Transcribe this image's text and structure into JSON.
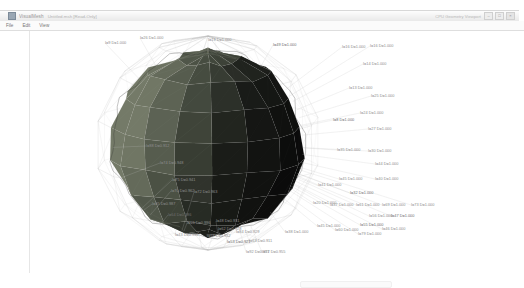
{
  "window": {
    "title": "VisualMesh",
    "subtitle": "Untitled.msh  [Read-Only]",
    "right_status": "CPU  Geometry Viewport",
    "controls": {
      "minimize": "–",
      "maximize": "□",
      "close": "×"
    }
  },
  "menubar": {
    "items": [
      "File",
      "Edit",
      "View"
    ]
  },
  "canvas": {
    "background": "#ffffff",
    "wire_color": "#b9b9b9",
    "outline_color": "#9b9b9b",
    "face_light": "#6a6f66",
    "face_mid": "#4a4f49",
    "face_dark": "#191919",
    "face_darkest": "#0a0a0a",
    "label_color": "#8e8e8e"
  },
  "vertex_labels": [
    {
      "text": "I=9 D=1.000",
      "x": 75,
      "y": 10
    },
    {
      "text": "I=26 D=1.000",
      "x": 110,
      "y": 5
    },
    {
      "text": "I=19 D=1.000",
      "x": 178,
      "y": 7
    },
    {
      "text": "I=49 D=1.000",
      "x": 243,
      "y": 12
    },
    {
      "text": "I=16 D=1.000",
      "x": 312,
      "y": 14
    },
    {
      "text": "I=16 D=1.000",
      "x": 340,
      "y": 13
    },
    {
      "text": "I=14 D=1.000",
      "x": 333,
      "y": 31
    },
    {
      "text": "I=13 D=1.000",
      "x": 319,
      "y": 55
    },
    {
      "text": "I=25 D=1.000",
      "x": 341,
      "y": 63
    },
    {
      "text": "I=24 D=1.000",
      "x": 330,
      "y": 80
    },
    {
      "text": "I=8 D=1.000",
      "x": 303,
      "y": 87
    },
    {
      "text": "I=27 D=1.000",
      "x": 338,
      "y": 96
    },
    {
      "text": "I=35 D=1.000",
      "x": 307,
      "y": 117
    },
    {
      "text": "I=30 D=1.000",
      "x": 338,
      "y": 118
    },
    {
      "text": "I=44 D=1.000",
      "x": 345,
      "y": 131
    },
    {
      "text": "I=40 D=1.000",
      "x": 345,
      "y": 146
    },
    {
      "text": "I=45 D=1.000",
      "x": 309,
      "y": 146
    },
    {
      "text": "I=32 D=1.000",
      "x": 320,
      "y": 160
    },
    {
      "text": "I=41 D=1.000",
      "x": 288,
      "y": 152
    },
    {
      "text": "I=37 D=1.000",
      "x": 300,
      "y": 172
    },
    {
      "text": "I=61 D=1.000",
      "x": 326,
      "y": 172
    },
    {
      "text": "I=69 D=1.000",
      "x": 352,
      "y": 172
    },
    {
      "text": "I=73 D=1.000",
      "x": 381,
      "y": 172
    },
    {
      "text": "I=56 D=1.000",
      "x": 339,
      "y": 183
    },
    {
      "text": "I=47 D=1.000",
      "x": 361,
      "y": 183
    },
    {
      "text": "I=88 D=0.912",
      "x": 116,
      "y": 113
    },
    {
      "text": "I=74 D=0.948",
      "x": 130,
      "y": 130
    },
    {
      "text": "I=75 D=0.941",
      "x": 142,
      "y": 147
    },
    {
      "text": "I=70 D=0.962",
      "x": 141,
      "y": 158
    },
    {
      "text": "I=72 D=0.963",
      "x": 164,
      "y": 159
    },
    {
      "text": "I=85 D=0.987",
      "x": 122,
      "y": 171
    },
    {
      "text": "I=64 D=0.986",
      "x": 138,
      "y": 182
    },
    {
      "text": "I=65 D=0.996",
      "x": 157,
      "y": 190
    },
    {
      "text": "I=48 D=0.931",
      "x": 186,
      "y": 188
    },
    {
      "text": "I=62 D=0.928",
      "x": 188,
      "y": 196
    },
    {
      "text": "I=84 D=0.929",
      "x": 206,
      "y": 199
    },
    {
      "text": "I=43 D=0.936",
      "x": 145,
      "y": 202
    },
    {
      "text": "I=68 D=0.932",
      "x": 177,
      "y": 203
    },
    {
      "text": "I=53 D=0.921",
      "x": 197,
      "y": 209
    },
    {
      "text": "I=63 D=0.911",
      "x": 219,
      "y": 208
    },
    {
      "text": "I=92 D=0.951",
      "x": 216,
      "y": 219
    },
    {
      "text": "I=77 D=0.955",
      "x": 232,
      "y": 219
    },
    {
      "text": "I=38 D=1.000",
      "x": 255,
      "y": 199
    },
    {
      "text": "I=45 D=1.000",
      "x": 287,
      "y": 193
    },
    {
      "text": "I=60 D=1.000",
      "x": 305,
      "y": 197
    },
    {
      "text": "I=55 D=1.000",
      "x": 330,
      "y": 192
    },
    {
      "text": "I=79 D=1.000",
      "x": 328,
      "y": 201
    },
    {
      "text": "I=46 D=1.000",
      "x": 352,
      "y": 196
    },
    {
      "text": "I=20 D=1.000",
      "x": 283,
      "y": 170
    }
  ],
  "hscroll": {
    "visible": true
  }
}
